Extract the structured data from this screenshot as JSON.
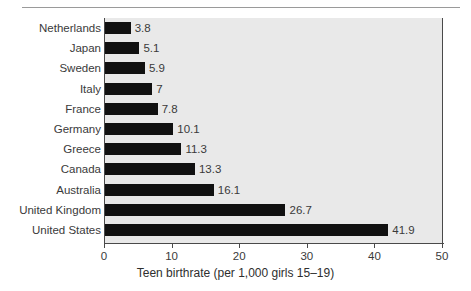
{
  "chart_data": {
    "type": "bar",
    "orientation": "horizontal",
    "title": "",
    "xlabel": "Teen birthrate (per 1,000 girls 15–19)",
    "ylabel": "",
    "categories": [
      "Netherlands",
      "Japan",
      "Sweden",
      "Italy",
      "France",
      "Germany",
      "Greece",
      "Canada",
      "Australia",
      "United Kingdom",
      "United States"
    ],
    "values": [
      3.8,
      5.1,
      5.9,
      7,
      7.8,
      10.1,
      11.3,
      13.3,
      16.1,
      26.7,
      41.9
    ],
    "value_labels": [
      "3.8",
      "5.1",
      "5.9",
      "7",
      "7.8",
      "10.1",
      "11.3",
      "13.3",
      "16.1",
      "26.7",
      "41.9"
    ],
    "xlim": [
      0,
      50
    ],
    "xticks": [
      0,
      10,
      20,
      30,
      40,
      50
    ],
    "xtick_labels": [
      "0",
      "10",
      "20",
      "30",
      "40",
      "50"
    ],
    "grid": false,
    "legend": false,
    "bar_color": "#111111",
    "plot_background": "#e9e9e9",
    "axis_color": "#4a4a4a",
    "text_color": "#3a3a3a"
  }
}
